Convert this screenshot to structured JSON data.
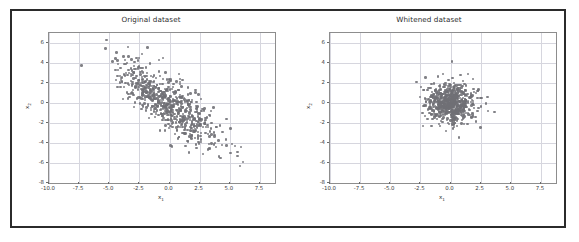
{
  "figure": {
    "background": "#ffffff",
    "border_color": "#2b2b2b",
    "marker_color": "#6f6f75",
    "grid_color": "#d6d6de"
  },
  "panels": [
    {
      "key": "original",
      "title": "Original dataset",
      "xlabel": "x",
      "xlabel_sub": "1",
      "ylabel": "x",
      "ylabel_sub": "2"
    },
    {
      "key": "whitened",
      "title": "Whitened dataset",
      "xlabel": "x",
      "xlabel_sub": "1",
      "ylabel": "x",
      "ylabel_sub": "2"
    }
  ],
  "chart_data": [
    {
      "type": "scatter",
      "title": "Original dataset",
      "xlabel": "x1",
      "ylabel": "x2",
      "xlim": [
        -10.0,
        8.75
      ],
      "ylim": [
        -8.0,
        7.0
      ],
      "xticks": [
        -10.0,
        -7.5,
        -5.0,
        -2.5,
        0.0,
        2.5,
        5.0,
        7.5
      ],
      "yticks": [
        -8,
        -6,
        -4,
        -2,
        0,
        2,
        4,
        6
      ],
      "xticklabels": [
        "-10.0",
        "-7.5",
        "-5.0",
        "-2.5",
        "0.0",
        "2.5",
        "5.0",
        "7.5"
      ],
      "yticklabels": [
        "-8",
        "-6",
        "-4",
        "-2",
        "0",
        "2",
        "4",
        "6"
      ],
      "grid": true,
      "legend": "none",
      "marker_color": "#6f6f75",
      "n_points": 700,
      "distribution": {
        "mean_x": -0.1,
        "mean_y": 0.0,
        "std_x": 2.0,
        "std_y": 2.0,
        "correlation": -0.76
      }
    },
    {
      "type": "scatter",
      "title": "Whitened dataset",
      "xlabel": "x1",
      "ylabel": "x2",
      "xlim": [
        -10.0,
        8.75
      ],
      "ylim": [
        -8.0,
        7.0
      ],
      "xticks": [
        -10.0,
        -7.5,
        -5.0,
        -2.5,
        0.0,
        2.5,
        5.0,
        7.5
      ],
      "yticks": [
        -8,
        -6,
        -4,
        -2,
        0,
        2,
        4,
        6
      ],
      "xticklabels": [
        "-10.0",
        "-7.5",
        "-5.0",
        "-2.5",
        "0.0",
        "2.5",
        "5.0",
        "7.5"
      ],
      "yticklabels": [
        "-8",
        "-6",
        "-4",
        "-2",
        "0",
        "2",
        "4",
        "6"
      ],
      "grid": true,
      "legend": "none",
      "marker_color": "#6f6f75",
      "n_points": 700,
      "distribution": {
        "mean_x": 0.0,
        "mean_y": 0.0,
        "std_x": 1.0,
        "std_y": 1.0,
        "correlation": 0.0
      }
    }
  ]
}
